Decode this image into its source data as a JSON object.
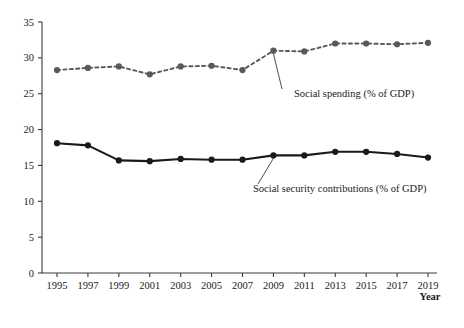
{
  "chart_data": {
    "type": "line",
    "title": "",
    "subtitle": "",
    "xlabel": "Year",
    "ylabel": "",
    "xlim": [
      1994,
      2020
    ],
    "ylim": [
      0,
      35
    ],
    "grid": false,
    "legend_position": "inline-annotation",
    "x": [
      1995,
      1996,
      1997,
      1998,
      1999,
      2000,
      2001,
      2002,
      2003,
      2004,
      2005,
      2006,
      2007,
      2008,
      2009,
      2010,
      2011,
      2012,
      2013,
      2014,
      2015,
      2016,
      2017,
      2018,
      2019
    ],
    "categories": [
      "1995",
      "1997",
      "1999",
      "2001",
      "2003",
      "2005",
      "2007",
      "2009",
      "2011",
      "2013",
      "2015",
      "2017",
      "2019"
    ],
    "x_tick_labels": [
      "1995",
      "1997",
      "1999",
      "2001",
      "2003",
      "2005",
      "2007",
      "2009",
      "2011",
      "2013",
      "2015",
      "2017",
      "2019"
    ],
    "x_tick_values": [
      1995,
      1997,
      1999,
      2001,
      2003,
      2005,
      2007,
      2009,
      2011,
      2013,
      2015,
      2017,
      2019
    ],
    "y_tick_labels": [
      "0",
      "5",
      "10",
      "15",
      "20",
      "25",
      "30",
      "35"
    ],
    "y_tick_values": [
      0,
      5,
      10,
      15,
      20,
      25,
      30,
      35
    ],
    "series": [
      {
        "name": "Social spending (% of GDP)",
        "style": "dashed",
        "marker": "circle",
        "color": "#595959",
        "x": [
          1995,
          1997,
          1999,
          2001,
          2003,
          2005,
          2007,
          2009,
          2011,
          2013,
          2015,
          2017,
          2019
        ],
        "values": [
          28.3,
          28.6,
          28.8,
          27.7,
          28.8,
          28.9,
          28.3,
          31.0,
          30.9,
          32.0,
          32.0,
          31.9,
          32.1
        ],
        "annotation": {
          "text": "Social spending (% of GDP)",
          "points_to_year": 2009
        }
      },
      {
        "name": "Social security contributions (% of GDP)",
        "style": "solid",
        "marker": "circle",
        "color": "#1a1a1a",
        "x": [
          1995,
          1997,
          1999,
          2001,
          2003,
          2005,
          2007,
          2009,
          2011,
          2013,
          2015,
          2017,
          2019
        ],
        "values": [
          18.1,
          17.8,
          15.7,
          15.6,
          15.9,
          15.8,
          15.8,
          16.4,
          16.4,
          16.9,
          16.9,
          16.6,
          16.1
        ],
        "annotation": {
          "text": "Social security contributions (% of GDP)",
          "points_to_year": 2009
        }
      }
    ]
  },
  "axes": {
    "x_axis_title": "Year",
    "y_axis_title": ""
  },
  "colors": {
    "axis": "#3a3a3a",
    "series_spending": "#595959",
    "series_contributions": "#1a1a1a",
    "background": "#ffffff",
    "text": "#1a1a1a"
  }
}
